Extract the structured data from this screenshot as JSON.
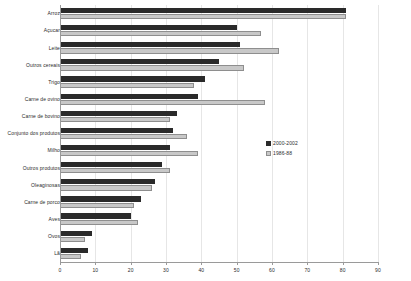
{
  "chart_data": {
    "type": "bar",
    "orientation": "horizontal",
    "title": "",
    "xlabel": "",
    "ylabel": "",
    "xlim": [
      0,
      90
    ],
    "xticks": [
      0,
      10,
      20,
      30,
      40,
      50,
      60,
      70,
      80,
      90
    ],
    "grid": true,
    "legend_position": "center-right",
    "categories": [
      "Arroz",
      "Açucar",
      "Leite",
      "Outros cereais",
      "Trigo",
      "Carne de ovino",
      "Carne de bovino",
      "Conjunto dos produtos",
      "Milho",
      "Outros produtos",
      "Oleaginosas",
      "Carne de porco",
      "Aves",
      "Ovos",
      "Lã"
    ],
    "series": [
      {
        "name": "2000-2002",
        "color": "#2a2a2a",
        "values": [
          81,
          50,
          51,
          45,
          41,
          39,
          33,
          32,
          31,
          29,
          27,
          23,
          20,
          9,
          8
        ]
      },
      {
        "name": "1986-88",
        "color": "#c8c8c8",
        "values": [
          81,
          57,
          62,
          52,
          38,
          58,
          31,
          36,
          39,
          31,
          26,
          21,
          22,
          7,
          6
        ]
      }
    ]
  },
  "legend": {
    "entries": [
      {
        "label": "2000-2002",
        "swatch": "recent"
      },
      {
        "label": "1986-88",
        "swatch": "older"
      }
    ]
  }
}
